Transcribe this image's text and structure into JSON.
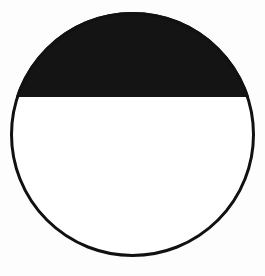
{
  "diagram": {
    "shape": "circle",
    "circle": {
      "cx": 132.5,
      "cy": 134.5,
      "r": 121,
      "stroke_color": "#111111",
      "stroke_width": 3,
      "fill_color": "#ffffff"
    },
    "filled_segment": {
      "position": "top",
      "chord_y": 97,
      "fill_color": "#141414"
    },
    "background_color": "#fdfdfd"
  }
}
